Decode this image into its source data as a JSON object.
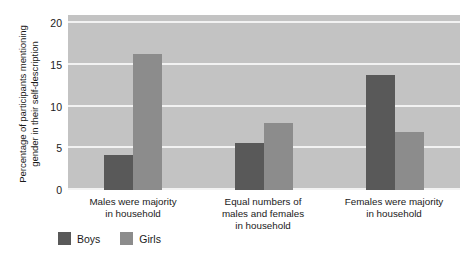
{
  "chart_data": {
    "type": "bar",
    "title": "",
    "xlabel": "",
    "ylabel": "Percentage of participants mentioning gender in their self-description",
    "ylabel_lines": [
      "Percentage of participants mentioning",
      "gender in their self-description"
    ],
    "categories": [
      "Males were majority in household",
      "Equal numbers of males and females in household",
      "Females were majority in household"
    ],
    "category_lines": [
      [
        "Males were majority",
        "in household"
      ],
      [
        "Equal numbers of",
        "males and females",
        "in household"
      ],
      [
        "Females were majority",
        "in household"
      ]
    ],
    "series": [
      {
        "name": "Boys",
        "color": "#595959",
        "values": [
          4.2,
          5.7,
          13.8
        ]
      },
      {
        "name": "Girls",
        "color": "#8c8c8c",
        "values": [
          16.3,
          8.0,
          7.0
        ]
      }
    ],
    "ylim": [
      0,
      21
    ],
    "yticks": [
      0,
      5,
      10,
      15,
      20
    ],
    "ytick_labels": [
      "0",
      "5",
      "10",
      "15",
      "20"
    ],
    "grid": true,
    "grid_color": "#f2f2f2",
    "plot_background": "#c3c3c3",
    "legend_position": "bottom-left"
  },
  "legend": {
    "entries": [
      {
        "label": "Boys",
        "color": "#595959"
      },
      {
        "label": "Girls",
        "color": "#8c8c8c"
      }
    ]
  }
}
